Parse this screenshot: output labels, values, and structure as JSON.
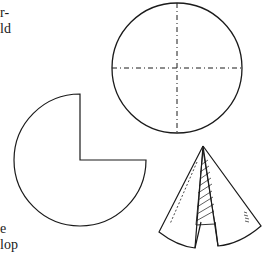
{
  "text_fragments": {
    "top_line_1": "r-",
    "top_line_2": "ld",
    "bottom_line_1": "e",
    "bottom_line_2": "lop"
  },
  "figures": {
    "full_circle": {
      "description": "circle with dashed crosshair center lines",
      "icon": "circle-crosshair-icon"
    },
    "cut_circle": {
      "description": "circle with one quarter sector removed",
      "icon": "three-quarter-circle-icon"
    },
    "cone": {
      "description": "cone formed by rolling the sector, with hatched overlap seam",
      "icon": "cone-icon"
    }
  },
  "colors": {
    "ink": "#1a1a1a",
    "paper": "#ffffff"
  }
}
